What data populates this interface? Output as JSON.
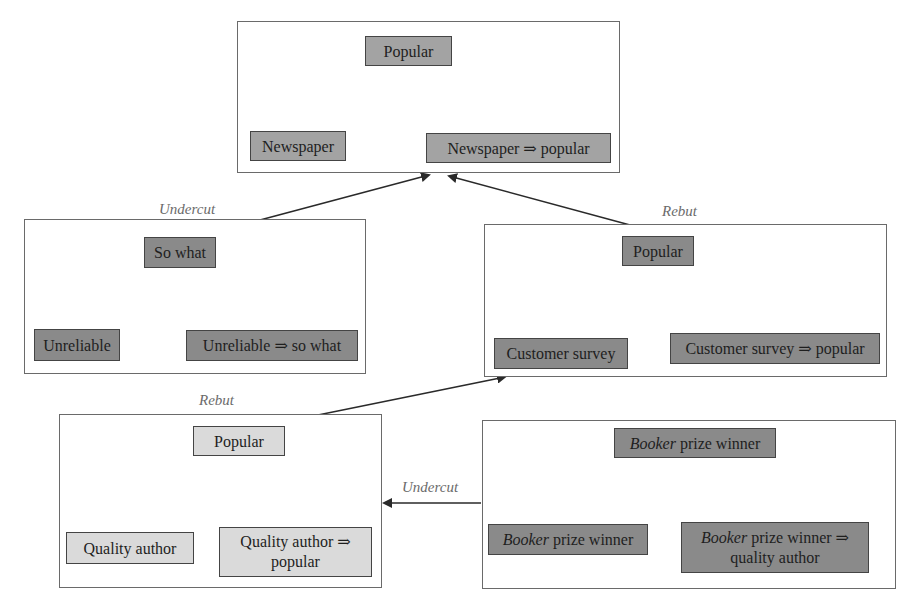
{
  "diagram": {
    "type": "argument-attack-graph",
    "arguments": [
      {
        "id": "arg-top",
        "claim": "Popular",
        "premises": [
          "Newspaper",
          "Newspaper ⇒ popular"
        ]
      },
      {
        "id": "arg-undercut-left",
        "claim": "So what",
        "premises": [
          "Unreliable",
          "Unreliable ⇒ so what"
        ]
      },
      {
        "id": "arg-rebut-right",
        "claim": "Popular",
        "premises": [
          "Customer survey",
          "Customer survey ⇒ popular"
        ]
      },
      {
        "id": "arg-rebut-bottom-left",
        "claim": "Popular",
        "premises": [
          "Quality author",
          "Quality author ⇒",
          "popular"
        ]
      },
      {
        "id": "arg-booker",
        "claim_italic": "Booker",
        "claim_rest": " prize winner",
        "premise1_italic": "Booker",
        "premise1_rest": " prize winner",
        "premise2_italic": "Booker",
        "premise2_rest": " prize winner ⇒",
        "premise2_line2": "quality author"
      }
    ],
    "attacks": [
      {
        "from": "arg-undercut-left",
        "to": "arg-top",
        "label": "Undercut"
      },
      {
        "from": "arg-rebut-right",
        "to": "arg-top",
        "label": "Rebut"
      },
      {
        "from": "arg-rebut-bottom-left",
        "to": "arg-rebut-right",
        "label": "Rebut"
      },
      {
        "from": "arg-booker",
        "to": "arg-rebut-bottom-left",
        "label": "Undercut"
      }
    ],
    "colors": {
      "frame_border": "#6a6a6a",
      "node_border": "#444444",
      "node_light": "#cfcfcf",
      "node_mid": "#a3a3a3",
      "node_dark": "#8a8a8a",
      "node_pale": "#dadada",
      "edge": "#2a2a2a",
      "label": "#6b6b6b"
    }
  }
}
